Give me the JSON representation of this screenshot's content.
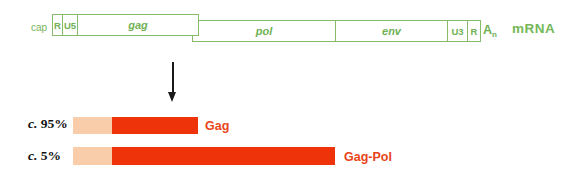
{
  "mrna": {
    "cap_label": "cap",
    "r5_label": "R",
    "u5_label": "U5",
    "gag_label": "gag",
    "pol_label": "pol",
    "env_label": "env",
    "u3_label": "U3",
    "r3_label": "R",
    "polya_base": "A",
    "polya_sub": "n",
    "type_label": "mRNA"
  },
  "products": {
    "rows": [
      {
        "circa": "c.",
        "percent": "95%",
        "protein": "Gag"
      },
      {
        "circa": "c.",
        "percent": "5%",
        "protein": "Gag-Pol"
      }
    ]
  },
  "icons": {
    "arrow_down": "down-arrow"
  },
  "colors": {
    "construct_green": "#86bc69",
    "green_text": "#6fb154",
    "leader_pink": "#f9cda9",
    "orf_red": "#ee330a",
    "protein_label_red": "#e94418",
    "arrow_black": "#1a1a1a"
  }
}
